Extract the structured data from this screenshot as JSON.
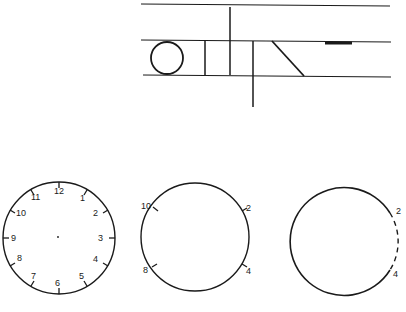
{
  "figure": {
    "top_panel": {
      "description": "writing guide lines with circle, vertical strokes and diagonal stroke",
      "shapes": [
        "circle",
        "short-vertical",
        "tall-vertical",
        "descender-vertical",
        "diagonal",
        "dash"
      ]
    },
    "clocks": [
      {
        "id": "full-clock",
        "numbers": [
          "12",
          "1",
          "2",
          "3",
          "4",
          "5",
          "6",
          "7",
          "8",
          "9",
          "10",
          "11"
        ]
      },
      {
        "id": "partial-clock",
        "numbers": [
          "10",
          "2",
          "8",
          "4"
        ]
      },
      {
        "id": "dashed-clock",
        "numbers": [
          "2",
          "4"
        ]
      }
    ]
  }
}
